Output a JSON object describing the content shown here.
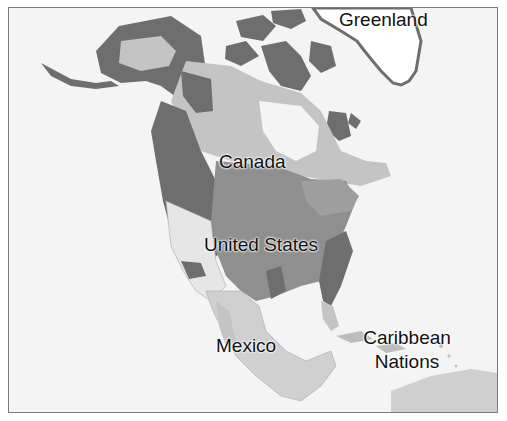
{
  "map": {
    "colors": {
      "background": "#f4f4f4",
      "frame": "#7a7a7a",
      "dark": "#6e6e6e",
      "medium": "#8f8f8f",
      "light": "#c4c4c4",
      "pale": "#e0e0e0",
      "greenland_ice": "#ffffff",
      "border_lines": "#9a9a9a"
    },
    "labels": {
      "greenland": "Greenland",
      "canada": "Canada",
      "united_states": "United States",
      "mexico": "Mexico",
      "caribbean_line1": "Caribbean",
      "caribbean_line2": "Nations"
    }
  }
}
